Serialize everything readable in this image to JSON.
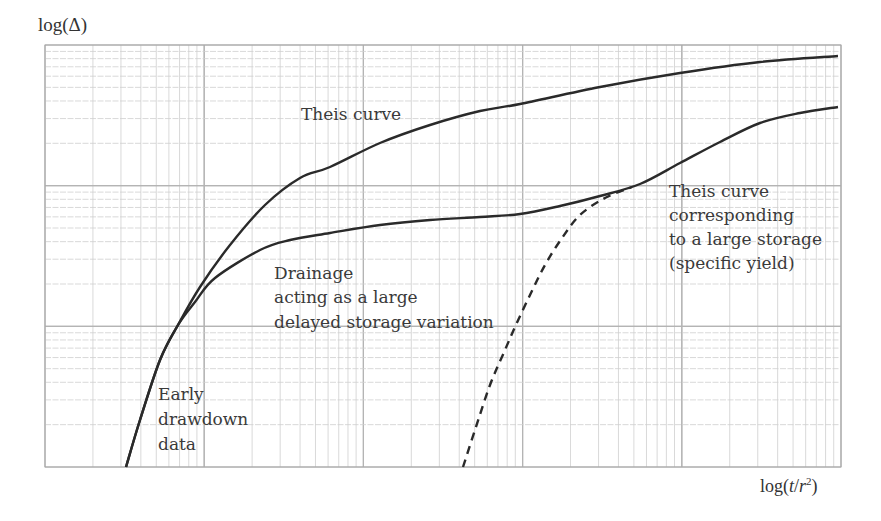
{
  "figure": {
    "y_axis_label": "log(Δ)",
    "x_axis_label_prefix": "log(",
    "x_axis_label_t": "t",
    "x_axis_label_slash": "/",
    "x_axis_label_r": "r",
    "x_axis_label_exp": "2",
    "x_axis_label_suffix": ")",
    "annotations": {
      "theis_curve": "Theis curve",
      "drainage": [
        "Drainage",
        "acting as a large",
        "delayed storage variation"
      ],
      "early": [
        "Early",
        "drawdown",
        "data"
      ],
      "specific_yield": [
        "Theis curve",
        "corresponding",
        "to a large storage",
        "(specific yield)"
      ]
    },
    "colors": {
      "curve": "#2a2a2a",
      "grid_minor": "#cfcfcf",
      "grid_major": "#b4b4b4",
      "text": "#3a3a3a",
      "background": "#ffffff"
    }
  },
  "chart_data": {
    "type": "line",
    "title": "",
    "xlabel": "log(t/r²)",
    "ylabel": "log(Δ)",
    "x_scale": "log",
    "y_scale": "log",
    "x_decades": 5,
    "y_decades": 3,
    "grid": true,
    "tick_labels": "none",
    "legend": "none (inline annotations)",
    "series": [
      {
        "name": "Theis curve",
        "style": "solid",
        "points_px": [
          [
            126,
            467
          ],
          [
            140,
            420
          ],
          [
            160,
            360
          ],
          [
            178,
            325
          ],
          [
            200,
            287
          ],
          [
            230,
            245
          ],
          [
            265,
            205
          ],
          [
            300,
            178
          ],
          [
            330,
            167
          ],
          [
            380,
            143
          ],
          [
            430,
            125
          ],
          [
            480,
            111
          ],
          [
            520,
            104
          ],
          [
            600,
            87
          ],
          [
            680,
            73
          ],
          [
            760,
            62
          ],
          [
            838,
            56
          ]
        ]
      },
      {
        "name": "Drainage acting as a large delayed storage variation (observed)",
        "style": "solid",
        "points_px": [
          [
            126,
            467
          ],
          [
            140,
            420
          ],
          [
            160,
            360
          ],
          [
            178,
            325
          ],
          [
            195,
            302
          ],
          [
            215,
            278
          ],
          [
            260,
            250
          ],
          [
            290,
            240
          ],
          [
            330,
            233
          ],
          [
            380,
            225
          ],
          [
            430,
            220
          ],
          [
            480,
            217
          ],
          [
            520,
            214
          ],
          [
            560,
            206
          ],
          [
            600,
            196
          ],
          [
            640,
            184
          ],
          [
            680,
            163
          ],
          [
            720,
            142
          ],
          [
            760,
            123
          ],
          [
            800,
            113
          ],
          [
            838,
            107
          ]
        ]
      },
      {
        "name": "Theis curve corresponding to a large storage (specific yield)",
        "style": "dashed",
        "points_px": [
          [
            463,
            467
          ],
          [
            475,
            430
          ],
          [
            490,
            385
          ],
          [
            505,
            350
          ],
          [
            515,
            327
          ],
          [
            530,
            295
          ],
          [
            545,
            265
          ],
          [
            562,
            238
          ],
          [
            580,
            215
          ],
          [
            605,
            198
          ],
          [
            632,
            187
          ]
        ]
      }
    ],
    "annotations": [
      {
        "text": "Theis curve",
        "near": "upper curve, left-center"
      },
      {
        "text": "Drainage acting as a large delayed storage variation",
        "near": "plateau of middle curve"
      },
      {
        "text": "Early drawdown data",
        "near": "steep initial segment, bottom-left"
      },
      {
        "text": "Theis curve corresponding to a large storage (specific yield)",
        "near": "dashed curve junction, right"
      }
    ]
  }
}
